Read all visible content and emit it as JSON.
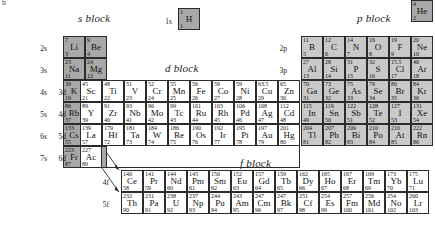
{
  "figure": {
    "corner_mark": "b",
    "blocks": [
      {
        "key": "s",
        "title": "s block"
      },
      {
        "key": "p",
        "title": "p block"
      },
      {
        "key": "d",
        "title": "d block"
      },
      {
        "key": "f",
        "title": "f block"
      }
    ]
  },
  "shell_labels": {
    "s": [
      "1s",
      "2s",
      "3s",
      "4s",
      "5s",
      "6s",
      "7s"
    ],
    "p": [
      "2p",
      "3p",
      "4p",
      "5p",
      "6p"
    ],
    "d": [
      "3d",
      "4d",
      "5d",
      "6d"
    ],
    "f": [
      "4f",
      "5f"
    ]
  },
  "hydrogen": {
    "mass": "1",
    "symbol": "H",
    "number": "1",
    "shell": "1s"
  },
  "helium": {
    "mass": "4",
    "symbol": "He",
    "number": "2"
  },
  "s_block": {
    "rows": [
      {
        "shell": "2s",
        "cells": [
          {
            "mass": "7",
            "symbol": "Li",
            "number": "3"
          },
          {
            "mass": "9",
            "symbol": "Be",
            "number": "4"
          }
        ]
      },
      {
        "shell": "3s",
        "cells": [
          {
            "mass": "23",
            "symbol": "Na",
            "number": "11"
          },
          {
            "mass": "24",
            "symbol": "Mg",
            "number": "12"
          }
        ]
      },
      {
        "shell": "4s",
        "cells": [
          {
            "mass": "39",
            "symbol": "K",
            "number": "19"
          },
          {
            "mass": "40",
            "symbol": "Ca",
            "number": "20"
          }
        ]
      },
      {
        "shell": "5s",
        "cells": [
          {
            "mass": "86",
            "symbol": "Rb",
            "number": "37"
          },
          {
            "mass": "88",
            "symbol": "Sr",
            "number": "38"
          }
        ]
      },
      {
        "shell": "6s",
        "cells": [
          {
            "mass": "133",
            "symbol": "Cs",
            "number": "55"
          },
          {
            "mass": "137",
            "symbol": "Ba",
            "number": "56"
          }
        ]
      },
      {
        "shell": "7s",
        "cells": [
          {
            "mass": "223",
            "symbol": "Fr",
            "number": "87"
          },
          {
            "mass": "226",
            "symbol": "Ra",
            "number": "88"
          }
        ]
      }
    ]
  },
  "p_block": {
    "rows": [
      {
        "shell": "2p",
        "cells": [
          {
            "mass": "11",
            "symbol": "B",
            "number": "5"
          },
          {
            "mass": "12",
            "symbol": "C",
            "number": "6"
          },
          {
            "mass": "14",
            "symbol": "N",
            "number": "7"
          },
          {
            "mass": "16",
            "symbol": "O",
            "number": "8"
          },
          {
            "mass": "19",
            "symbol": "F",
            "number": "9"
          },
          {
            "mass": "20",
            "symbol": "Ne",
            "number": "10"
          }
        ]
      },
      {
        "shell": "3p",
        "cells": [
          {
            "mass": "27",
            "symbol": "Al",
            "number": "13"
          },
          {
            "mass": "28",
            "symbol": "Si",
            "number": "14"
          },
          {
            "mass": "31",
            "symbol": "P",
            "number": "15"
          },
          {
            "mass": "32",
            "symbol": "S",
            "number": "16"
          },
          {
            "mass": "15.5",
            "symbol": "Cl",
            "number": "17"
          },
          {
            "mass": "40",
            "symbol": "Ar",
            "number": "18"
          }
        ]
      },
      {
        "shell": "4p",
        "cells": [
          {
            "mass": "70",
            "symbol": "Ga",
            "number": "31"
          },
          {
            "mass": "73",
            "symbol": "Ge",
            "number": "32"
          },
          {
            "mass": "75",
            "symbol": "As",
            "number": "33"
          },
          {
            "mass": "79",
            "symbol": "Se",
            "number": "34"
          },
          {
            "mass": "80",
            "symbol": "Br",
            "number": "35"
          },
          {
            "mass": "84",
            "symbol": "Kr",
            "number": "36"
          }
        ]
      },
      {
        "shell": "5p",
        "cells": [
          {
            "mass": "115",
            "symbol": "In",
            "number": "49"
          },
          {
            "mass": "119",
            "symbol": "Sn",
            "number": "50"
          },
          {
            "mass": "122",
            "symbol": "Sb",
            "number": "51"
          },
          {
            "mass": "128",
            "symbol": "Te",
            "number": "52"
          },
          {
            "mass": "127",
            "symbol": "I",
            "number": "53"
          },
          {
            "mass": "131",
            "symbol": "Xe",
            "number": "54"
          }
        ]
      },
      {
        "shell": "6p",
        "cells": [
          {
            "mass": "204",
            "symbol": "Tl",
            "number": "81"
          },
          {
            "mass": "207",
            "symbol": "Pb",
            "number": "82"
          },
          {
            "mass": "209",
            "symbol": "Bi",
            "number": "83"
          },
          {
            "mass": "210",
            "symbol": "Po",
            "number": "84"
          },
          {
            "mass": "210",
            "symbol": "At",
            "number": "85"
          },
          {
            "mass": "222",
            "symbol": "Rn",
            "number": "86"
          }
        ]
      }
    ]
  },
  "d_block": {
    "rows": [
      {
        "shell": "3d",
        "cells": [
          {
            "mass": "45",
            "symbol": "Sc",
            "number": "21"
          },
          {
            "mass": "48",
            "symbol": "Ti",
            "number": "22"
          },
          {
            "mass": "51",
            "symbol": "V",
            "number": "23"
          },
          {
            "mass": "52",
            "symbol": "Cr",
            "number": "24"
          },
          {
            "mass": "55",
            "symbol": "Mn",
            "number": "25"
          },
          {
            "mass": "56",
            "symbol": "Fe",
            "number": "26"
          },
          {
            "mass": "59",
            "symbol": "Co",
            "number": "27"
          },
          {
            "mass": "59",
            "symbol": "Ni",
            "number": "28"
          },
          {
            "mass": "63.5",
            "symbol": "Cu",
            "number": "29"
          },
          {
            "mass": "65",
            "symbol": "Zn",
            "number": "30"
          }
        ]
      },
      {
        "shell": "4d",
        "cells": [
          {
            "mass": "89",
            "symbol": "Y",
            "number": "39"
          },
          {
            "mass": "91",
            "symbol": "Zr",
            "number": "40"
          },
          {
            "mass": "93",
            "symbol": "Nb",
            "number": "41"
          },
          {
            "mass": "96",
            "symbol": "Mo",
            "number": "42"
          },
          {
            "mass": "99",
            "symbol": "Tc",
            "number": "43"
          },
          {
            "mass": "101",
            "symbol": "Ru",
            "number": "44"
          },
          {
            "mass": "103",
            "symbol": "Rh",
            "number": "45"
          },
          {
            "mass": "106",
            "symbol": "Pd",
            "number": "46"
          },
          {
            "mass": "108",
            "symbol": "Ag",
            "number": "47"
          },
          {
            "mass": "112",
            "symbol": "Cd",
            "number": "48"
          }
        ]
      },
      {
        "shell": "5d",
        "cells": [
          {
            "mass": "139",
            "symbol": "La",
            "number": "57"
          },
          {
            "mass": "179",
            "symbol": "Hf",
            "number": "72"
          },
          {
            "mass": "181",
            "symbol": "Ta",
            "number": "73"
          },
          {
            "mass": "184",
            "symbol": "W",
            "number": "74"
          },
          {
            "mass": "186",
            "symbol": "Re",
            "number": "75"
          },
          {
            "mass": "190",
            "symbol": "Os",
            "number": "76"
          },
          {
            "mass": "192",
            "symbol": "Ir",
            "number": "77"
          },
          {
            "mass": "195",
            "symbol": "Pt",
            "number": "78"
          },
          {
            "mass": "197",
            "symbol": "Au",
            "number": "79"
          },
          {
            "mass": "201",
            "symbol": "Hg",
            "number": "80"
          }
        ]
      },
      {
        "shell": "6d",
        "cells": [
          {
            "mass": "227",
            "symbol": "Ac",
            "number": "89"
          }
        ]
      }
    ]
  },
  "f_block": {
    "rows": [
      {
        "shell": "4f",
        "cells": [
          {
            "mass": "140",
            "symbol": "Ce",
            "number": "58"
          },
          {
            "mass": "141",
            "symbol": "Pr",
            "number": "59"
          },
          {
            "mass": "144",
            "symbol": "Nd",
            "number": "60"
          },
          {
            "mass": "145",
            "symbol": "Pm",
            "number": "61"
          },
          {
            "mass": "150",
            "symbol": "Sm",
            "number": "62"
          },
          {
            "mass": "152",
            "symbol": "Eu",
            "number": "63"
          },
          {
            "mass": "157",
            "symbol": "Gd",
            "number": "64"
          },
          {
            "mass": "159",
            "symbol": "Tb",
            "number": "65"
          },
          {
            "mass": "162",
            "symbol": "Dy",
            "number": "66"
          },
          {
            "mass": "165",
            "symbol": "Ho",
            "number": "67"
          },
          {
            "mass": "167",
            "symbol": "Er",
            "number": "68"
          },
          {
            "mass": "169",
            "symbol": "Tm",
            "number": "69"
          },
          {
            "mass": "173",
            "symbol": "Yb",
            "number": "70"
          },
          {
            "mass": "175",
            "symbol": "Lu",
            "number": "71"
          }
        ]
      },
      {
        "shell": "5f",
        "cells": [
          {
            "mass": "232",
            "symbol": "Th",
            "number": "90"
          },
          {
            "mass": "231",
            "symbol": "Pa",
            "number": "91"
          },
          {
            "mass": "238",
            "symbol": "U",
            "number": "92"
          },
          {
            "mass": "237",
            "symbol": "Np",
            "number": "93"
          },
          {
            "mass": "244",
            "symbol": "Pu",
            "number": "94"
          },
          {
            "mass": "243",
            "symbol": "Am",
            "number": "95"
          },
          {
            "mass": "247",
            "symbol": "Cm",
            "number": "96"
          },
          {
            "mass": "247",
            "symbol": "Bk",
            "number": "97"
          },
          {
            "mass": "251",
            "symbol": "Cf",
            "number": "98"
          },
          {
            "mass": "254",
            "symbol": "Es",
            "number": "99"
          },
          {
            "mass": "257",
            "symbol": "Fm",
            "number": "100"
          },
          {
            "mass": "256",
            "symbol": "Md",
            "number": "101"
          },
          {
            "mass": "254",
            "symbol": "No",
            "number": "102"
          },
          {
            "mass": "260",
            "symbol": "Lr",
            "number": "103"
          }
        ]
      }
    ]
  },
  "colors": {
    "s_block_fill": "#a8a8a8",
    "p_block_fill": "#c9c9c9",
    "d_block_fill": "#ffffff",
    "f_block_fill": "#ffffff",
    "border": "#2b2b2b",
    "text": "#111111",
    "background": "#ffffff"
  }
}
